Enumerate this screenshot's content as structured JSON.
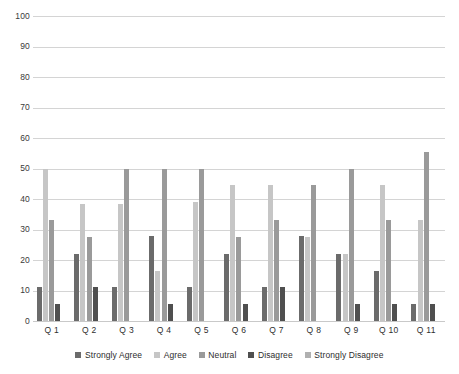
{
  "chart_data": {
    "type": "bar",
    "title": "",
    "subtitle": "",
    "xlabel": "",
    "ylabel": "",
    "ylim": [
      0,
      100
    ],
    "ytick_step": 10,
    "yticks": [
      100,
      90,
      80,
      70,
      60,
      50,
      40,
      30,
      20,
      10,
      0
    ],
    "grid": true,
    "legend_position": "bottom",
    "orientation": "vertical",
    "grouping": "clustered",
    "categories": [
      "Q 1",
      "Q 2",
      "Q 3",
      "Q 4",
      "Q 5",
      "Q 6",
      "Q 7",
      "Q 8",
      "Q 9",
      "Q 10",
      "Q 11"
    ],
    "series": [
      {
        "name": "Strongly Agree",
        "color": "#6b6b6b",
        "values": [
          11,
          22,
          11,
          28,
          11,
          22,
          11,
          28,
          22,
          16.5,
          5.5
        ]
      },
      {
        "name": "Agree",
        "color": "#c6c6c6",
        "values": [
          50,
          38.5,
          38.5,
          16.5,
          39,
          44.5,
          44.5,
          27.5,
          22,
          44.5,
          33
        ]
      },
      {
        "name": "Neutral",
        "color": "#9a9a9a",
        "values": [
          33,
          27.5,
          50,
          50,
          50,
          27.5,
          33,
          44.5,
          50,
          33,
          55.5
        ]
      },
      {
        "name": "Disagree",
        "color": "#4f4f4f",
        "values": [
          5.5,
          11,
          0,
          5.5,
          0,
          5.5,
          11,
          0,
          5.5,
          5.5,
          5.5
        ]
      },
      {
        "name": "Strongly Disagree",
        "color": "#b0b0b0",
        "values": [
          0,
          0,
          0,
          0,
          0,
          0,
          0,
          0,
          0,
          0,
          0
        ]
      }
    ]
  },
  "legend": {
    "items": [
      {
        "label": "Strongly Agree",
        "color": "#6b6b6b"
      },
      {
        "label": "Agree",
        "color": "#c6c6c6"
      },
      {
        "label": "Neutral",
        "color": "#9a9a9a"
      },
      {
        "label": "Disagree",
        "color": "#4f4f4f"
      },
      {
        "label": "Strongly Disagree",
        "color": "#b0b0b0"
      }
    ]
  },
  "axis": {
    "gridline_color": "#d4d4d4",
    "tick_text_color": "#3a3a3a"
  }
}
